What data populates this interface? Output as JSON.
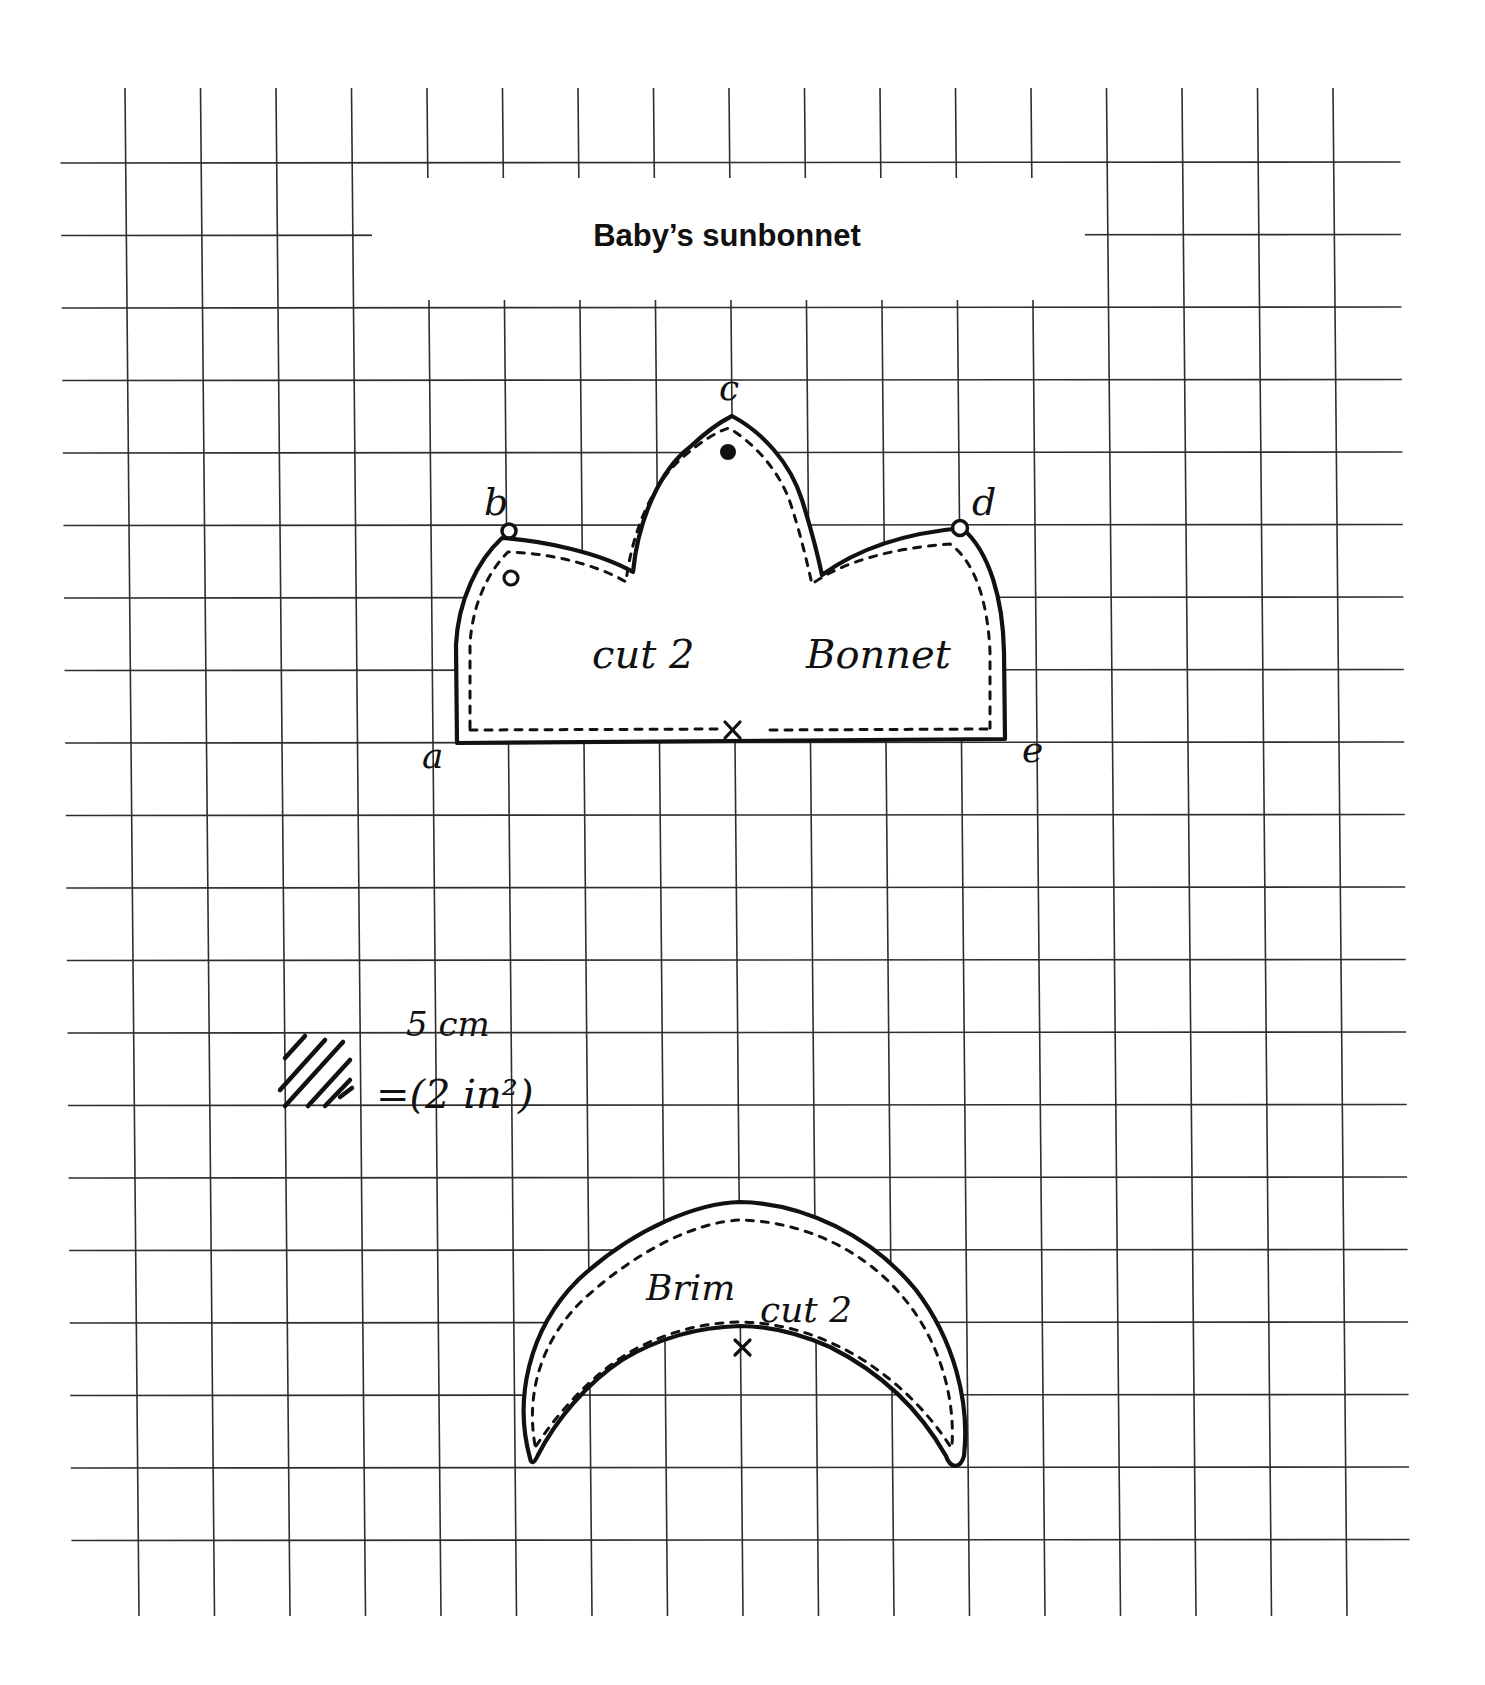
{
  "title": "Baby’s sunbonnet",
  "grid": {
    "v_count": 17,
    "v_x0_top": 125,
    "v_spacing": 75.5,
    "v_y_top": 88,
    "v_y_bottom": 1616,
    "skew_px": 14,
    "h_count": 20,
    "h_y0": 163,
    "h_spacing": 72.5,
    "h_x_left_top": 60,
    "h_x_left_bottom": 72,
    "h_x_right_top": 1400,
    "h_x_right_bottom": 1410,
    "title_gap": {
      "x1": 372,
      "x2": 1085,
      "y1": 178,
      "y2": 300
    },
    "line_color": "#2e2e2e"
  },
  "bonnet": {
    "piece_name": "Bonnet",
    "instruction": "cut 2",
    "points": {
      "a": "a",
      "b": "b",
      "c": "c",
      "d": "d",
      "e": "e"
    },
    "center_mark": "×"
  },
  "brim": {
    "piece_name": "Brim",
    "instruction": "cut 2",
    "center_mark": "×"
  },
  "scale": {
    "metric": "5 cm",
    "imperial": "=(2 in²)"
  }
}
